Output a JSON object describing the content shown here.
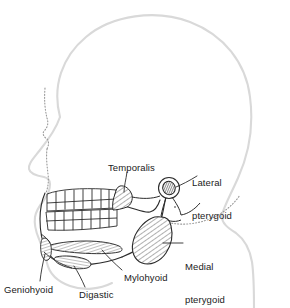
{
  "figure": {
    "view": "left lateral profile, facing left",
    "line_colors": {
      "head_outline": "#d9d9d9",
      "profile_dotted": "#9a9a9a",
      "bone_outline": "#2b2b2b",
      "muscle_hatch": "#3a3a3a",
      "leader_line": "#2b2b2b",
      "label_text": "#1a1a1a",
      "background": "#ffffff"
    },
    "labels": [
      {
        "id": "temporalis",
        "text": "Temporalis",
        "lines": [
          "Temporalis"
        ],
        "x": 108,
        "y": 162,
        "anchor": "start",
        "points_to": "hatched muscle at coronoid process of mandible"
      },
      {
        "id": "lateral-pterygoid",
        "text": "Lateral pterygoid",
        "lines": [
          "Lateral",
          "pterygoid"
        ],
        "x": 192,
        "y": 155,
        "anchor": "start",
        "points_to": "small dark hatched oval at the mandibular condyle"
      },
      {
        "id": "medial-pterygoid",
        "text": "Medial pterygoid",
        "lines": [
          "Medial",
          "pterygoid"
        ],
        "x": 185,
        "y": 239,
        "anchor": "start",
        "points_to": "large hatched teardrop muscle at angle of mandible"
      },
      {
        "id": "mylohyoid",
        "text": "Mylohyoid",
        "lines": [
          "Mylohyoid"
        ],
        "x": 124,
        "y": 272,
        "anchor": "start",
        "points_to": "upper elongated striated band below the mandible"
      },
      {
        "id": "digastic",
        "text": "Digastic",
        "lines": [
          "Digastic"
        ],
        "x": 79,
        "y": 289,
        "anchor": "start",
        "points_to": "small striated oval muscle below mylohyoid"
      },
      {
        "id": "geniohyoid",
        "text": "Geniohyoid",
        "lines": [
          "Geniohyoid"
        ],
        "x": 4,
        "y": 284,
        "anchor": "start",
        "points_to": "striated muscle at the anterior mandible / chin region"
      }
    ],
    "structures": [
      {
        "id": "head-outline",
        "name": "head-and-neck-outline",
        "style": "light grey contour"
      },
      {
        "id": "facial-profile",
        "name": "facial-profile-dotted",
        "style": "dotted grey line for nose, lips and chin"
      },
      {
        "id": "maxilla-teeth",
        "name": "upper-dental-arch",
        "count": 8,
        "style": "black outlined teeth"
      },
      {
        "id": "mandible-teeth",
        "name": "lower-dental-arch",
        "count": 8,
        "style": "black outlined teeth"
      },
      {
        "id": "mandible",
        "name": "mandible-bone",
        "style": "black outline"
      },
      {
        "id": "temporalis-muscle",
        "name": "temporalis-muscle",
        "style": "diagonal hatch"
      },
      {
        "id": "lateral-pterygoid-muscle",
        "name": "lateral-pterygoid-muscle",
        "style": "dark cross hatch in circle"
      },
      {
        "id": "medial-pterygoid-muscle",
        "name": "medial-pterygoid-muscle",
        "style": "diagonal hatch teardrop"
      },
      {
        "id": "mylohyoid-muscle",
        "name": "mylohyoid-muscle",
        "style": "fine striations"
      },
      {
        "id": "digastric-muscle",
        "name": "digastric-muscle",
        "style": "fine striations"
      },
      {
        "id": "geniohyoid-muscle",
        "name": "geniohyoid-muscle",
        "style": "fine striations"
      }
    ]
  }
}
